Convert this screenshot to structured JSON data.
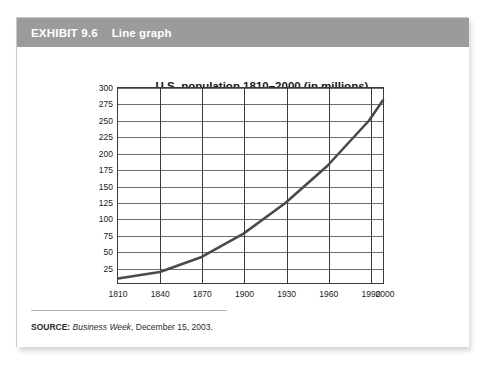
{
  "header": {
    "exhibit_number": "EXHIBIT 9.6",
    "exhibit_title": "Line graph",
    "bar_color": "#9b9b9b",
    "text_color": "#ffffff"
  },
  "source": {
    "label": "SOURCE:",
    "publication": "Business Week",
    "rest": ", December 15, 2003."
  },
  "chart_data": {
    "type": "line",
    "title": "U.S. population 1810–2000 (in millions)",
    "xlabel": "",
    "ylabel": "",
    "xlim": [
      1810,
      2000
    ],
    "ylim": [
      0,
      300
    ],
    "grid": true,
    "legend": false,
    "line_color": "#4a4a4a",
    "x_tick_labels": [
      "1810",
      "1840",
      "1870",
      "1900",
      "1930",
      "1960",
      "1990",
      "2000"
    ],
    "x_ticks": [
      1810,
      1840,
      1870,
      1900,
      1930,
      1960,
      1990,
      2000
    ],
    "y_tick_labels": [
      "25",
      "50",
      "75",
      "100",
      "125",
      "150",
      "175",
      "200",
      "225",
      "250",
      "275",
      "300"
    ],
    "y_ticks": [
      25,
      50,
      75,
      100,
      125,
      150,
      175,
      200,
      225,
      250,
      275,
      300
    ],
    "x": [
      1810,
      1840,
      1870,
      1900,
      1930,
      1960,
      1990,
      2000
    ],
    "values": [
      7,
      17,
      40,
      76,
      123,
      180,
      250,
      281
    ],
    "series": [
      {
        "name": "U.S. population",
        "x": [
          1810,
          1840,
          1870,
          1900,
          1930,
          1960,
          1990,
          2000
        ],
        "values": [
          7,
          17,
          40,
          76,
          123,
          180,
          250,
          281
        ]
      }
    ]
  }
}
